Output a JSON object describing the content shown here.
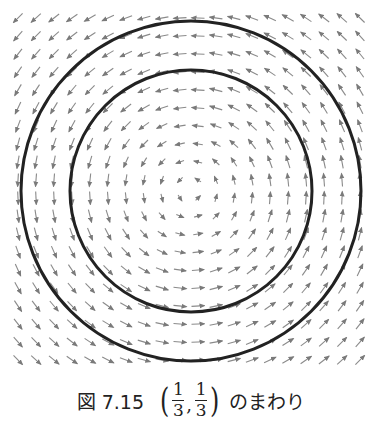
{
  "figure": {
    "type": "vector_field",
    "center_px": [
      191,
      191
    ],
    "grid": {
      "x_start": 18,
      "y_start": 18,
      "step": 18,
      "count": 20
    },
    "arrow_length_px": 13,
    "arrow_color": "#8a8a8a",
    "rotation": "counter-clockwise",
    "circles": [
      {
        "name": "outer-orbit",
        "radius_px": 170,
        "stroke": "#222222",
        "stroke_width": 3
      },
      {
        "name": "inner-orbit",
        "radius_px": 121,
        "stroke": "#222222",
        "stroke_width": 3
      }
    ]
  },
  "caption": {
    "label": "図 7.15",
    "point": {
      "x_num": "1",
      "x_den": "3",
      "y_num": "1",
      "y_den": "3",
      "open": "(",
      "close": ")",
      "sep": ","
    },
    "text": "のまわり"
  }
}
